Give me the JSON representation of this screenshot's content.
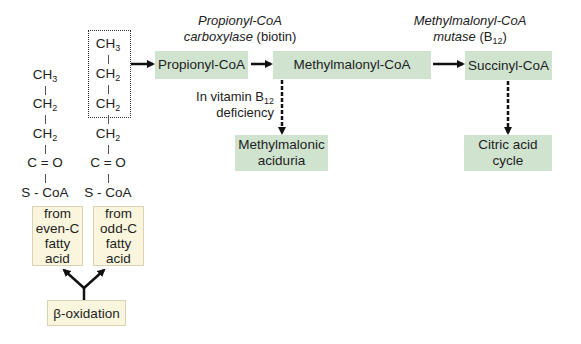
{
  "left_chain": {
    "label": "from even-C fatty acid",
    "rows": [
      "CH3",
      "CH2",
      "CH2",
      "C = O",
      "S - CoA"
    ]
  },
  "right_chain": {
    "label": "from odd-C fatty acid",
    "rows": [
      "CH3",
      "CH2",
      "CH2",
      "CH2",
      "C = O",
      "S - CoA"
    ]
  },
  "boxes": {
    "even_c": [
      "from",
      "even-C",
      "fatty",
      "acid"
    ],
    "odd_c": [
      "from",
      "odd-C",
      "fatty",
      "acid"
    ],
    "beta_oxidation": "β-oxidation",
    "propionyl_coa": "Propionyl-CoA",
    "methylmalonyl_coa": "Methylmalonyl-CoA",
    "succinyl_coa": "Succinyl-CoA",
    "methylmalonic_aciduria": [
      "Methylmalonic",
      "aciduria"
    ],
    "citric_acid_cycle": [
      "Citric acid",
      "cycle"
    ]
  },
  "enzymes": {
    "carboxylase": {
      "line1": "Propionyl-CoA",
      "line2_italic": "carboxylase",
      "line2_plain": " (biotin)"
    },
    "mutase": {
      "line1": "Methylmalonyl-CoA",
      "line2_italic": "mutase",
      "line2_plain": " (B",
      "sub": "12",
      "close": ")"
    }
  },
  "deficiency_note": {
    "line1_prefix": "In vitamin B",
    "sub": "12",
    "line2": "deficiency"
  },
  "colors": {
    "green_box": "#cfe3cf",
    "yellow_box": "#faf5dd",
    "arrow": "#111111"
  }
}
